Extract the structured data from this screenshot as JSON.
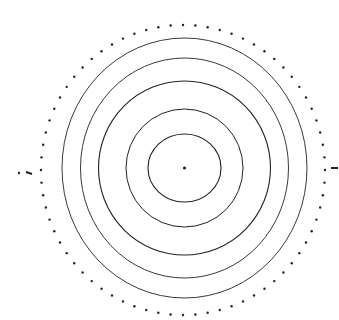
{
  "diagram": {
    "type": "concentric-circles",
    "background": "#ffffff",
    "stroke_color": "#222222",
    "center": {
      "x": 184.5,
      "y": 168
    },
    "center_dot": {
      "r": 1.6
    },
    "rings": [
      {
        "rx": 36.5,
        "ry": 34,
        "stroke_width": 1.1
      },
      {
        "rx": 58.5,
        "ry": 59,
        "stroke_width": 1.0
      },
      {
        "rx": 86,
        "ry": 87,
        "stroke_width": 1.1
      },
      {
        "rx": 104,
        "ry": 110,
        "stroke_width": 0.9
      },
      {
        "rx": 122.5,
        "ry": 130,
        "stroke_width": 0.9
      }
    ],
    "dotted_ring": {
      "cx": 183,
      "cy": 170,
      "rx": 142,
      "ry": 145,
      "dot_count": 72,
      "dot_r": 1.2
    },
    "markers": [
      {
        "side": "left",
        "x1": 26,
        "y1": 172,
        "x2": 32,
        "y2": 174,
        "dot_x": 19,
        "dot_y": 173
      },
      {
        "side": "right",
        "x1": 331,
        "y1": 168,
        "x2": 338,
        "y2": 168
      }
    ]
  }
}
